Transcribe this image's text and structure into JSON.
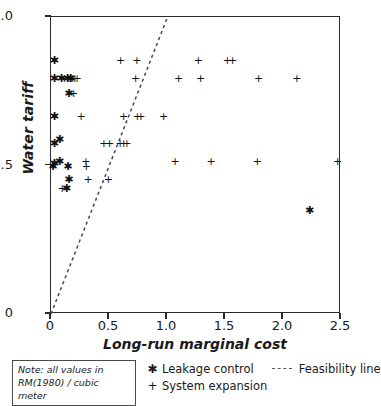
{
  "chart_data": {
    "type": "scatter",
    "title": "",
    "xlabel": "Long-run marginal cost",
    "ylabel": "Water tariff",
    "xlim": [
      0,
      2.5
    ],
    "ylim": [
      0,
      1.0
    ],
    "xticks": [
      "0",
      "0.5",
      "1.0",
      "1.5",
      "2.0",
      "2.5"
    ],
    "xtick_values": [
      0,
      0.5,
      1.0,
      1.5,
      2.0,
      2.5
    ],
    "yticks": [
      "0",
      "0.5",
      "1.0"
    ],
    "ytick_values": [
      0,
      0.5,
      1.0
    ],
    "grid": false,
    "legend_position": "below-axes",
    "note": "Note: all values in RM(1980)/cubic meter",
    "series": [
      {
        "name": "Leakage control",
        "marker": "asterisk",
        "glyph": "✱",
        "points": [
          [
            0.03,
            0.855
          ],
          [
            0.03,
            0.795
          ],
          [
            0.09,
            0.795
          ],
          [
            0.14,
            0.795
          ],
          [
            0.17,
            0.795
          ],
          [
            0.155,
            0.745
          ],
          [
            0.03,
            0.665
          ],
          [
            0.03,
            0.575
          ],
          [
            0.075,
            0.59
          ],
          [
            0.03,
            0.51
          ],
          [
            0.075,
            0.515
          ],
          [
            0.015,
            0.497
          ],
          [
            0.145,
            0.497
          ],
          [
            0.155,
            0.455
          ],
          [
            0.135,
            0.425
          ],
          [
            2.23,
            0.35
          ]
        ]
      },
      {
        "name": "System expansion",
        "marker": "plus",
        "glyph": "+",
        "points": [
          [
            0.6,
            0.855
          ],
          [
            0.74,
            0.855
          ],
          [
            1.27,
            0.855
          ],
          [
            1.52,
            0.855
          ],
          [
            1.565,
            0.855
          ],
          [
            0.115,
            0.795
          ],
          [
            0.145,
            0.795
          ],
          [
            0.165,
            0.795
          ],
          [
            0.185,
            0.795
          ],
          [
            0.205,
            0.795
          ],
          [
            0.225,
            0.795
          ],
          [
            0.73,
            0.795
          ],
          [
            1.1,
            0.795
          ],
          [
            1.29,
            0.795
          ],
          [
            1.79,
            0.795
          ],
          [
            2.12,
            0.795
          ],
          [
            0.195,
            0.745
          ],
          [
            0.26,
            0.665
          ],
          [
            0.625,
            0.665
          ],
          [
            0.745,
            0.665
          ],
          [
            0.775,
            0.665
          ],
          [
            0.97,
            0.665
          ],
          [
            0.455,
            0.575
          ],
          [
            0.505,
            0.575
          ],
          [
            0.595,
            0.575
          ],
          [
            0.625,
            0.575
          ],
          [
            0.655,
            0.575
          ],
          [
            0.3,
            0.515
          ],
          [
            1.07,
            0.515
          ],
          [
            1.38,
            0.515
          ],
          [
            1.78,
            0.515
          ],
          [
            2.47,
            0.515
          ],
          [
            0.305,
            0.497
          ],
          [
            0.32,
            0.455
          ],
          [
            0.495,
            0.455
          ],
          [
            0.095,
            0.425
          ]
        ]
      }
    ],
    "reference_line": {
      "name": "Feasibility line",
      "style": "dashed",
      "from": [
        0.0,
        0.0
      ],
      "to": [
        1.005,
        1.0
      ]
    }
  },
  "legend": {
    "leakage_label": "Leakage control",
    "leakage_glyph": "✱",
    "expansion_label": "System expansion",
    "expansion_glyph": "+",
    "feasibility_label": "Feasibility line"
  },
  "note_box": {
    "line1": "Note: all values in",
    "line2": "RM(1980) / cubic meter"
  }
}
